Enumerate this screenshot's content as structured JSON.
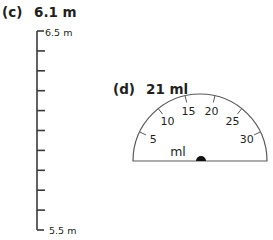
{
  "part_c": {
    "label": "(c)",
    "reading": "6.1 m",
    "ruler": {
      "top_label": "6.5 m",
      "bottom_label": "5.5 m",
      "top_value": 6.5,
      "bottom_value": 5.5,
      "step": 0.1,
      "tick_count": 11
    }
  },
  "part_d": {
    "label": "(d)",
    "reading": "21 ml",
    "gauge": {
      "unit": "ml",
      "min": 0,
      "max": 35,
      "tick_labels": [
        "5",
        "10",
        "15",
        "20",
        "25",
        "30"
      ],
      "tick_values": [
        5,
        10,
        15,
        20,
        25,
        30
      ]
    }
  },
  "colors": {
    "ink": "#231f20",
    "line": "#5a5a5a",
    "background": "#ffffff"
  }
}
